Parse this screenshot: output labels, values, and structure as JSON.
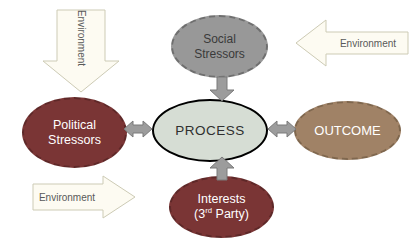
{
  "diagram": {
    "environment_label": "Environment",
    "env_arrow": {
      "fill": "#fdfbf2",
      "stroke": "#cdcbb5",
      "text_color": "#595959"
    },
    "connector": {
      "fill": "#9c9c9c",
      "stroke": "#7a7a7a"
    },
    "nodes": {
      "social": {
        "line1": "Social",
        "line2": "Stressors",
        "fill": "#989898",
        "border_color": "#6f6f6f",
        "border_style": "dashed",
        "text_color": "#3a3a3a"
      },
      "political": {
        "line1": "Political",
        "line2": "Stressors",
        "fill": "#7a3535",
        "border_color": "#5e2828",
        "border_style": "dashed",
        "text_color": "#ffffff"
      },
      "process": {
        "label": "PROCESS",
        "fill": "#d6ddd4",
        "border_color": "#000000",
        "border_style": "solid",
        "text_color": "#2f2f2f"
      },
      "outcome": {
        "label": "OUTCOME",
        "fill": "#a08266",
        "border_color": "#7f674e",
        "border_style": "dashed",
        "text_color": "#ffffff"
      },
      "interests": {
        "line1": "Interests",
        "line2_open": "(3",
        "line2_sup": "rd",
        "line2_rest": " Party)",
        "fill": "#7a3535",
        "border_color": "#5e2828",
        "border_style": "dashed",
        "text_color": "#ffffff"
      }
    }
  }
}
